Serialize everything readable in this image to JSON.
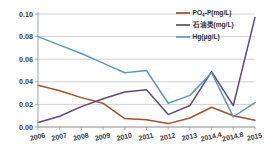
{
  "chart_data": {
    "type": "line",
    "title": "",
    "xlabel": "",
    "ylabel": "",
    "categories": [
      "2006",
      "2007",
      "2008",
      "2009",
      "2010",
      "2011",
      "2012",
      "2013",
      "2014.4",
      "2014.8",
      "2015"
    ],
    "ylim": [
      0.0,
      0.1
    ],
    "ytick_labels": [
      "0.00",
      "0.02",
      "0.04",
      "0.06",
      "0.08",
      "0.10"
    ],
    "ytick_values": [
      0.0,
      0.02,
      0.04,
      0.06,
      0.08,
      0.1
    ],
    "grid": true,
    "legend_position": "top-right",
    "series": [
      {
        "name": "PO4-P(mg/L)",
        "name_main": "PO",
        "name_sub": "4",
        "name_rest": "-P(mg/L)",
        "color": "#a0522d",
        "values": [
          0.037,
          0.032,
          0.026,
          0.021,
          0.0075,
          0.0065,
          0.003,
          0.008,
          0.0175,
          0.01,
          0.006
        ]
      },
      {
        "name": "石油类(mg/L)",
        "color": "#5b4b7a",
        "values": [
          0.004,
          0.0095,
          0.018,
          0.025,
          0.031,
          0.033,
          0.011,
          0.019,
          0.049,
          0.019,
          0.097
        ]
      },
      {
        "name": "Hg(μg/L)",
        "color": "#5b9bbd",
        "values": [
          0.08,
          0.0725,
          0.065,
          0.0565,
          0.048,
          0.05,
          0.021,
          0.028,
          0.048,
          0.009,
          0.0215
        ]
      }
    ]
  },
  "axis": {
    "y_labels": [
      "0.10",
      "0.08",
      "0.06",
      "0.04",
      "0.02",
      "0.00"
    ],
    "x_labels": [
      "2006",
      "2007",
      "2008",
      "2009",
      "2010",
      "2011",
      "2012",
      "2013",
      "2014.4",
      "2014.8",
      "2015"
    ]
  },
  "legend": {
    "items": [
      {
        "label": "PO4-P(mg/L)",
        "color": "#a0522d"
      },
      {
        "label": "石油类(mg/L)",
        "color": "#5b4b7a"
      },
      {
        "label": "Hg(μg/L)",
        "color": "#5b9bbd"
      }
    ]
  }
}
